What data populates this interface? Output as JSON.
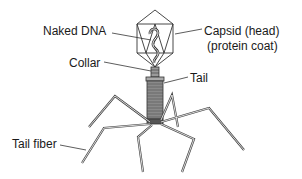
{
  "diagram": {
    "labels": {
      "naked_dna": "Naked DNA",
      "capsid_line1": "Capsid (head)",
      "capsid_line2": "(protein coat)",
      "collar": "Collar",
      "tail": "Tail",
      "tail_fiber": "Tail fiber"
    },
    "colors": {
      "ink": "#1a1a1a",
      "sheath_fill": "#8a8a8a",
      "background": "#ffffff"
    }
  }
}
